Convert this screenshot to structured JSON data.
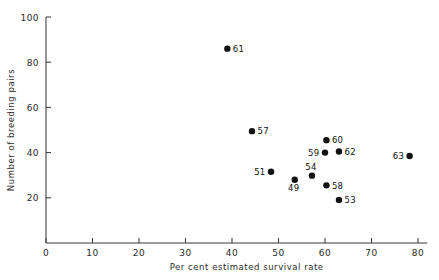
{
  "figure": {
    "background_color": "#ffffff",
    "ink_color": "#111111"
  },
  "chart_data": {
    "type": "scatter",
    "title": "",
    "subtitle": "",
    "xlabel": "Per cent estimated survival rate",
    "ylabel": "Number of breeding pairs",
    "xlim": [
      0,
      82
    ],
    "ylim": [
      0,
      100
    ],
    "xticks": [
      0,
      10,
      20,
      30,
      40,
      50,
      60,
      70,
      80
    ],
    "xticklabels": [
      "0",
      "10",
      "20",
      "30",
      "40",
      "50",
      "60",
      "70",
      "80"
    ],
    "yticks": [
      0,
      20,
      40,
      60,
      80,
      100
    ],
    "yticklabels": [
      "",
      "20",
      "40",
      "60",
      "80",
      "100"
    ],
    "grid": false,
    "legend": null,
    "marker": "filled-circle",
    "marker_color": "#111111",
    "marker_size": 3.2,
    "points": [
      {
        "label": "61",
        "x": 39.0,
        "y": 86.0,
        "label_side": "right"
      },
      {
        "label": "57",
        "x": 44.3,
        "y": 49.5,
        "label_side": "right"
      },
      {
        "label": "60",
        "x": 60.3,
        "y": 45.5,
        "label_side": "right"
      },
      {
        "label": "62",
        "x": 63.0,
        "y": 40.5,
        "label_side": "right"
      },
      {
        "label": "59",
        "x": 60.0,
        "y": 40.0,
        "label_side": "left"
      },
      {
        "label": "63",
        "x": 78.2,
        "y": 38.5,
        "label_side": "left"
      },
      {
        "label": "51",
        "x": 48.4,
        "y": 31.5,
        "label_side": "left"
      },
      {
        "label": "54",
        "x": 57.2,
        "y": 29.8,
        "label_side": "above"
      },
      {
        "label": "49",
        "x": 53.5,
        "y": 28.0,
        "label_side": "below"
      },
      {
        "label": "58",
        "x": 60.3,
        "y": 25.5,
        "label_side": "right"
      },
      {
        "label": "53",
        "x": 63.0,
        "y": 19.0,
        "label_side": "right"
      }
    ]
  }
}
